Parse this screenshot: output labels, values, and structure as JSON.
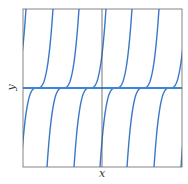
{
  "axes": {
    "xlabel": "x",
    "ylabel": "y"
  },
  "colors": {
    "curve": "#3a78c8",
    "frame": "#555555",
    "equilibrium": "#3d86d6"
  },
  "plot": {
    "left": 23,
    "top": 9,
    "right": 182,
    "bottom": 167,
    "axis_x": 102,
    "equilibrium_y": 88
  },
  "curves": {
    "centers": [
      -17,
      10,
      37,
      63,
      90,
      116,
      143,
      170,
      197,
      223
    ],
    "coefficient": 0.0193
  }
}
